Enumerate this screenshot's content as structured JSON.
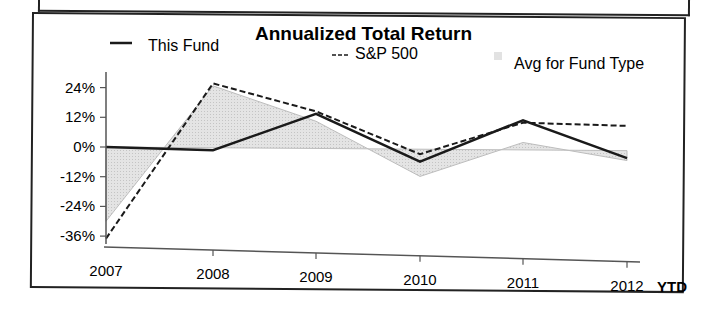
{
  "chart_data": {
    "type": "line",
    "title": "Annualized Total Return",
    "xlabel": "",
    "ylabel": "",
    "categories": [
      "2007",
      "2008",
      "2009",
      "2010",
      "2011",
      "2012"
    ],
    "x_suffix_label": "YTD",
    "y_ticks": [
      "24%",
      "12%",
      "0%",
      "-12%",
      "-24%",
      "-36%"
    ],
    "y_tick_values": [
      24,
      12,
      0,
      -12,
      -24,
      -36
    ],
    "ylim": [
      -38,
      28
    ],
    "grid": false,
    "legend_position": "top",
    "series": [
      {
        "name": "This Fund",
        "style": "solid",
        "legend_marker": "—",
        "values": [
          0,
          -1,
          14,
          -5,
          12,
          -3
        ]
      },
      {
        "name": "S&P 500",
        "style": "dashed",
        "legend_marker": "---",
        "values": [
          -37,
          26,
          15,
          -2,
          11,
          10
        ]
      },
      {
        "name": "Avg for Fund Type",
        "style": "area",
        "legend_marker": "▪",
        "values": [
          -30,
          25,
          11,
          -11,
          3,
          -4
        ]
      }
    ]
  },
  "colors": {
    "fund_line": "#1a1a1a",
    "sp500_line": "#1a1a1a",
    "avg_area_fill": "#d9d9d9",
    "avg_area_stroke": "#bdbdbd",
    "axis": "#555555"
  }
}
